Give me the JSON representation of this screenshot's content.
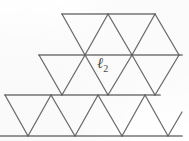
{
  "figure": {
    "kind": "triangular-lattice",
    "background_color": "#ffffff",
    "line_color": "#5e5e5e",
    "horizontal_line_color": "#6a6a6a",
    "label_color": "#4a4a4a",
    "canvas": {
      "width": 189,
      "height": 141
    }
  },
  "label": {
    "name": "cell-label",
    "base": "ℓ",
    "subscript": "2",
    "full_text": "ℓ2",
    "x": 97,
    "y": 56
  },
  "geometry": {
    "row_y": [
      14,
      55,
      95,
      136
    ],
    "side_half_width": 23.5,
    "horizontal_lines": [
      {
        "name": "top-edge",
        "y": 14,
        "x1": 62,
        "x2": 155
      },
      {
        "name": "second-row",
        "y": 55,
        "x1": 39,
        "x2": 182
      },
      {
        "name": "third-row",
        "y": 95,
        "x1": 5,
        "x2": 160
      },
      {
        "name": "bottom-edge",
        "y": 136,
        "x1": 0,
        "x2": 182
      }
    ],
    "down_right_edges": [
      {
        "x1": 62,
        "y1": 14,
        "x2": 85,
        "y2": 55
      },
      {
        "x1": 85,
        "y1": 55,
        "x2": 108,
        "y2": 14
      },
      {
        "x1": 108,
        "y1": 14,
        "x2": 132,
        "y2": 55
      },
      {
        "x1": 132,
        "y1": 55,
        "x2": 155,
        "y2": 14
      },
      {
        "x1": 155,
        "y1": 14,
        "x2": 179,
        "y2": 55
      },
      {
        "x1": 39,
        "y1": 55,
        "x2": 62,
        "y2": 95
      },
      {
        "x1": 62,
        "y1": 95,
        "x2": 85,
        "y2": 55
      },
      {
        "x1": 85,
        "y1": 55,
        "x2": 108,
        "y2": 95
      },
      {
        "x1": 108,
        "y1": 95,
        "x2": 132,
        "y2": 55
      },
      {
        "x1": 132,
        "y1": 55,
        "x2": 155,
        "y2": 95
      },
      {
        "x1": 155,
        "y1": 95,
        "x2": 179,
        "y2": 55
      },
      {
        "x1": 5,
        "y1": 95,
        "x2": 28,
        "y2": 136
      },
      {
        "x1": 28,
        "y1": 136,
        "x2": 51,
        "y2": 95
      },
      {
        "x1": 51,
        "y1": 95,
        "x2": 75,
        "y2": 136
      },
      {
        "x1": 75,
        "y1": 136,
        "x2": 98,
        "y2": 95
      },
      {
        "x1": 98,
        "y1": 95,
        "x2": 122,
        "y2": 136
      },
      {
        "x1": 122,
        "y1": 136,
        "x2": 145,
        "y2": 95
      },
      {
        "x1": 145,
        "y1": 95,
        "x2": 168,
        "y2": 136
      },
      {
        "x1": 168,
        "y1": 136,
        "x2": 182,
        "y2": 112
      }
    ],
    "vertices_marked": [
      {
        "x": 85,
        "y": 55
      },
      {
        "x": 132,
        "y": 55
      },
      {
        "x": 62,
        "y": 95
      },
      {
        "x": 108,
        "y": 95
      },
      {
        "x": 155,
        "y": 95
      },
      {
        "x": 28,
        "y": 136
      },
      {
        "x": 75,
        "y": 136
      },
      {
        "x": 122,
        "y": 136
      }
    ]
  }
}
